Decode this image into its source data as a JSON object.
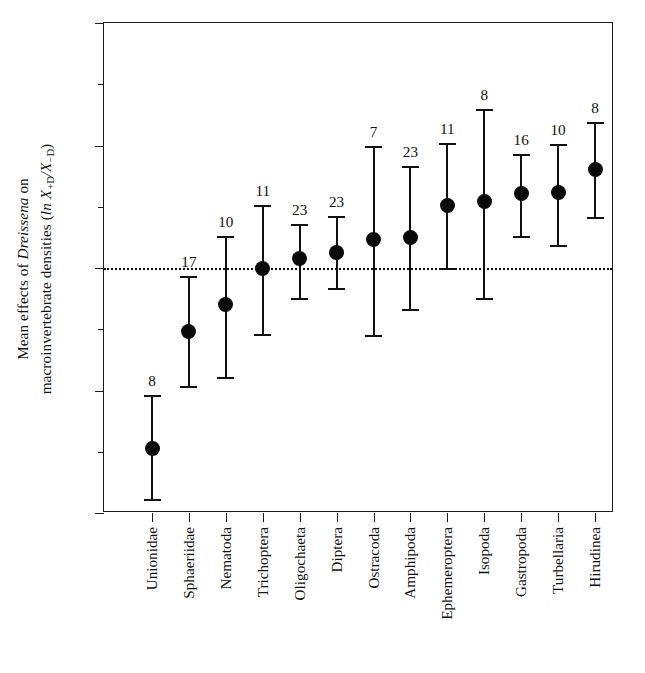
{
  "chart_data": {
    "type": "scatter",
    "title": "",
    "subtitle": "",
    "xlabel": "",
    "ylabel": "Mean effects of Dreissena on macroinvertebrate densities (ln X+D/X-D)",
    "ylabel_line1_prefix": "Mean effects of ",
    "ylabel_line1_italic": "Dreissena",
    "ylabel_line1_suffix": " on",
    "ylabel_line2_prefix": "macroinvertebrate densities (",
    "ylabel_line2_italic": "ln",
    "ylabel_line2_x": " X",
    "ylabel_line2_sub1": "+D",
    "ylabel_line2_slash": "/X",
    "ylabel_line2_sub2": "−D",
    "ylabel_line2_suffix": ")",
    "ylim": [
      -4,
      4
    ],
    "ytick_labels": [
      "4",
      "2",
      "0",
      "−2",
      "−4"
    ],
    "ytick_values": [
      4,
      2,
      0,
      -2,
      -4
    ],
    "yminor_values": [
      3,
      1,
      -1,
      -3
    ],
    "grid": false,
    "legend": "none",
    "zero_reference_line": 0,
    "error_bar_type": "95% confidence interval",
    "sample_size_label_position": "above upper error bar cap",
    "categories": [
      "Unionidae",
      "Sphaeriidae",
      "Nematoda",
      "Trichoptera",
      "Oligochaeta",
      "Diptera",
      "Ostracoda",
      "Amphipoda",
      "Ephemeroptera",
      "Isopoda",
      "Gastropoda",
      "Turbellaria",
      "Hirudinea"
    ],
    "values": [
      -2.95,
      -1.03,
      -0.6,
      0.0,
      0.15,
      0.26,
      0.47,
      0.49,
      1.02,
      1.09,
      1.21,
      1.24,
      1.61
    ],
    "ci_lower": [
      -3.77,
      -1.93,
      -1.78,
      -1.07,
      -0.49,
      -0.33,
      -1.09,
      -0.67,
      0.0,
      -0.49,
      0.53,
      0.38,
      0.83
    ],
    "ci_upper": [
      -2.08,
      -0.13,
      0.53,
      1.03,
      0.72,
      0.85,
      2.0,
      1.66,
      2.04,
      2.6,
      1.86,
      2.02,
      2.39
    ],
    "sample_sizes": [
      8,
      17,
      10,
      11,
      23,
      23,
      7,
      23,
      11,
      8,
      16,
      10,
      8
    ],
    "marker": "filled-circle",
    "marker_color": "#0a0a0a",
    "line_color": "#111111",
    "background_color": "#ffffff"
  }
}
